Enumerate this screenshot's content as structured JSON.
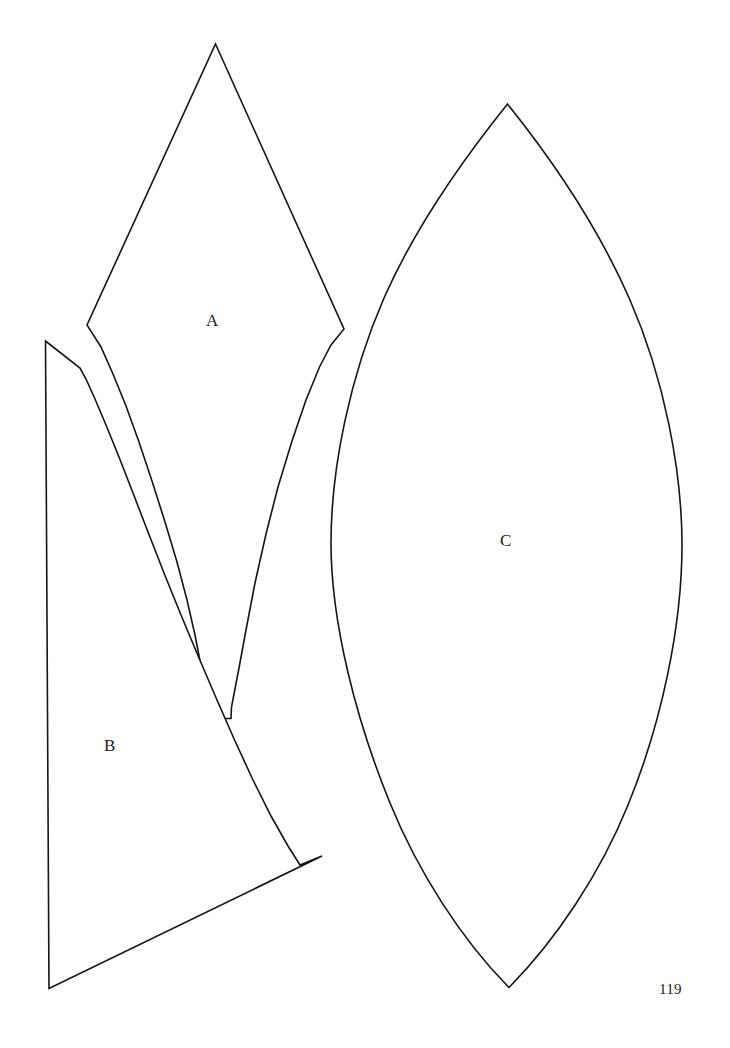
{
  "page": {
    "kind": "printed-book-page",
    "background_color": "#ffffff",
    "ink_color": "#151515",
    "page_number": "119",
    "width": 730,
    "height": 1048
  },
  "diagram": {
    "title": "",
    "stroke_color": "#151515",
    "fill_color": "#ffffff",
    "stroke_width": 1.6,
    "pieces": [
      {
        "id": "A",
        "label": "A",
        "shape": "kite with tapering slotted stem",
        "label_x": 213,
        "label_y": 321,
        "bbox": [
          87,
          44,
          344,
          719
        ],
        "path": "M 215.5 44 L 344 329 L 331 345 L 319.5 367 L 306 400 L 292 441 L 278 487 L 266 534 L 255 583 L 246 630 L 239 668 L 234 694 L 231.5 707 L 231 718.5 L 207.5 718.5 L 207 706 L 205 692 L 201 666 L 195 635 L 187 600 L 177 562 L 165 522 L 152 481 L 139 442 L 126 406 L 113 374 L 101 347 L 87 325 Z"
      },
      {
        "id": "B",
        "label": "B",
        "shape": "tall triangle with concave right edge and notched top",
        "label_x": 110,
        "label_y": 746,
        "bbox": [
          45,
          341,
          322,
          989
        ],
        "path": "M 45.5 341 L 80 368 L 86 379 L 95 399 L 106 425 L 119 457 L 133 493 L 148 532 L 164 573 L 181 615 L 199 658 L 217 700 L 235 741 L 253 780 L 271 816 L 288 846 L 300 865 L 322 856 L 49 988.5 Z"
      },
      {
        "id": "C",
        "label": "C",
        "shape": "pointed oval vesica / lens leaf",
        "label_x": 506,
        "label_y": 541,
        "bbox": [
          331,
          104,
          682,
          988
        ],
        "path": "M 507.5 104 C 546 152 596 222 630 300 C 664 378 682 470 682 545 C 682 625 662 722 628 805 C 600 874 556 940 509 987.5 C 462 940 418 872 390 803 C 356 720 331 622 331 543 C 331 468 350 376 384 298 C 418 221 469 152 507.5 104 Z"
      }
    ]
  },
  "labels": {
    "a": "A",
    "b": "B",
    "c": "C"
  }
}
